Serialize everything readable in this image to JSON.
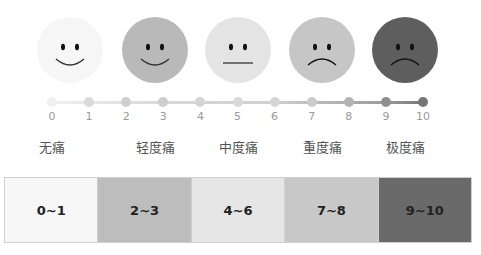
{
  "faces": [
    {
      "id": "none",
      "color": "#f6f6f6",
      "mouth": "smile"
    },
    {
      "id": "mild",
      "color": "#b9b9b9",
      "mouth": "smile"
    },
    {
      "id": "moderate",
      "color": "#e4e4e4",
      "mouth": "flat"
    },
    {
      "id": "severe",
      "color": "#c6c6c6",
      "mouth": "frown"
    },
    {
      "id": "extreme",
      "color": "#5e5e5e",
      "mouth": "frown"
    }
  ],
  "scale": {
    "numbers": [
      "0",
      "1",
      "2",
      "3",
      "4",
      "5",
      "6",
      "7",
      "8",
      "9",
      "10"
    ],
    "dot_colors": [
      "#f0f0f0",
      "#dadada",
      "#cfcfcf",
      "#cdcdcd",
      "#d4d4d4",
      "#d8d8d8",
      "#d6d6d6",
      "#cbcbcb",
      "#b4b4b4",
      "#8e8e8e",
      "#777777"
    ]
  },
  "levels": [
    "无痛",
    "轻度痛",
    "中度痛",
    "重度痛",
    "极度痛"
  ],
  "ranges": [
    {
      "label": "0~1",
      "color": "#f7f7f7"
    },
    {
      "label": "2~3",
      "color": "#bdbdbd"
    },
    {
      "label": "4~6",
      "color": "#e6e6e6"
    },
    {
      "label": "7~8",
      "color": "#c8c8c8"
    },
    {
      "label": "9~10",
      "color": "#6a6a6a"
    }
  ]
}
